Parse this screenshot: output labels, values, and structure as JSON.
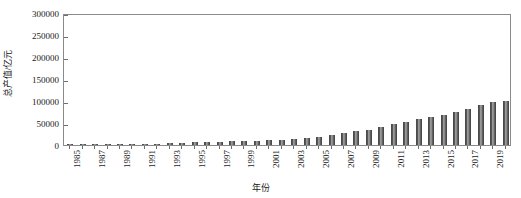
{
  "chart_data": {
    "type": "bar",
    "title": "",
    "xlabel": "年份",
    "ylabel": "总产值/亿元",
    "ylim": [
      0,
      300000
    ],
    "ytick_labels": [
      "0",
      "50000",
      "100000",
      "150000",
      "200000",
      "250000",
      "300000"
    ],
    "ytick_values": [
      0,
      50000,
      100000,
      150000,
      200000,
      250000,
      300000
    ],
    "grid": false,
    "legend": "none",
    "bar_color": "#595959",
    "axis_color": "#8a8a8a",
    "categories": [
      "1985",
      "1986",
      "1987",
      "1988",
      "1989",
      "1990",
      "1991",
      "1992",
      "1993",
      "1994",
      "1995",
      "1996",
      "1997",
      "1998",
      "1999",
      "2000",
      "2001",
      "2002",
      "2003",
      "2004",
      "2005",
      "2006",
      "2007",
      "2008",
      "2009",
      "2010",
      "2011",
      "2012",
      "2013",
      "2014",
      "2015",
      "2016",
      "2017",
      "2018",
      "2019",
      "2020"
    ],
    "xtick_labels": [
      "1985",
      "1987",
      "1989",
      "1991",
      "1993",
      "1995",
      "1997",
      "1999",
      "2001",
      "2003",
      "2005",
      "2007",
      "2009",
      "2011",
      "2013",
      "2015",
      "2017",
      "2019"
    ],
    "values": [
      9099,
      10377,
      12175,
      15181,
      17180,
      18873,
      22006,
      27195,
      35674,
      48638,
      61340,
      71814,
      79715,
      85196,
      90564,
      100280,
      110863,
      121717,
      137422,
      161840,
      187319,
      219439,
      270092,
      319245,
      348518,
      412119,
      487940,
      538580,
      592963,
      643563,
      688858,
      746395,
      832036,
      919281,
      986515,
      1015986
    ],
    "values_scaled": [
      900,
      1030,
      1210,
      1500,
      1700,
      1870,
      2180,
      2690,
      3530,
      4820,
      6080,
      7120,
      7900,
      8450,
      8980,
      9940,
      10990,
      12060,
      13620,
      16040,
      18560,
      21750,
      26770,
      31640,
      34540,
      40840,
      48350,
      53380,
      58760,
      63780,
      68270,
      73970,
      82470,
      91090,
      97780,
      101000
    ],
    "annotations": []
  },
  "axes": {
    "y_title": "总产值/亿元",
    "x_title": "年份"
  }
}
